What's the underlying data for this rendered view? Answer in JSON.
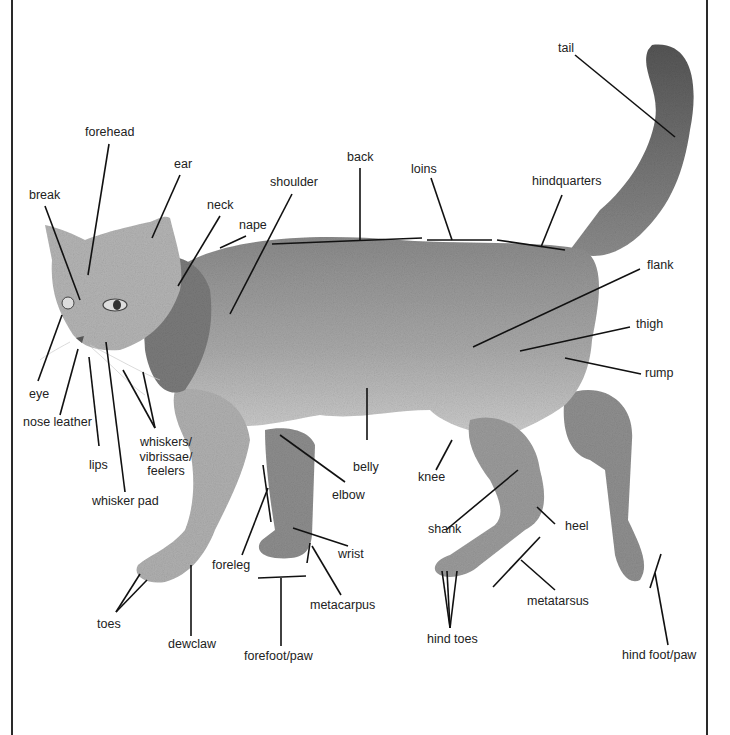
{
  "diagram": {
    "type": "anatomical labeled illustration",
    "colors": {
      "ink": "#222222",
      "fur_light": "#c9c9c9",
      "fur_mid": "#9a9a9a",
      "fur_dark": "#5e5e5e",
      "frame": "#2a2a2a",
      "background": "#ffffff"
    }
  },
  "labels": {
    "tail": "tail",
    "forehead": "forehead",
    "ear": "ear",
    "back": "back",
    "loins": "loins",
    "hindquarters": "hindquarters",
    "shoulder": "shoulder",
    "break": "break",
    "neck": "neck",
    "nape": "nape",
    "flank": "flank",
    "thigh": "thigh",
    "rump": "rump",
    "eye": "eye",
    "nose_leather": "nose leather",
    "lips": "lips",
    "whiskers_1": "whiskers/",
    "whiskers_2": "vibrissae/",
    "whiskers_3": "feelers",
    "whisker_pad": "whisker pad",
    "belly": "belly",
    "elbow": "elbow",
    "knee": "knee",
    "shank": "shank",
    "heel": "heel",
    "foreleg": "foreleg",
    "wrist": "wrist",
    "metacarpus": "metacarpus",
    "metatarsus": "metatarsus",
    "toes": "toes",
    "dewclaw": "dewclaw",
    "forefoot_paw": "forefoot/paw",
    "hind_toes": "hind toes",
    "hind_foot_paw": "hind foot/paw"
  }
}
